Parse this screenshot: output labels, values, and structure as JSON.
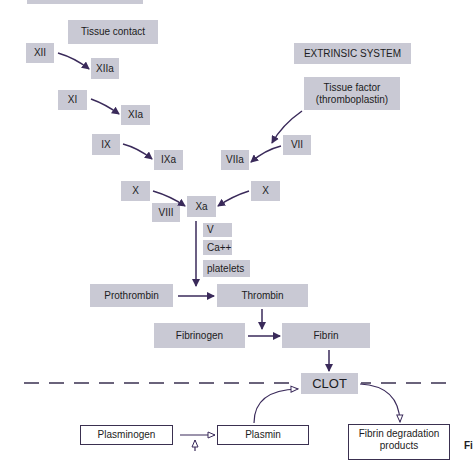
{
  "diagram": {
    "type": "coagulation cascade",
    "intrinsic": {
      "trigger": "Tissue contact",
      "steps": [
        {
          "from": "XII",
          "to": "XIIa"
        },
        {
          "from": "XI",
          "to": "XIa"
        },
        {
          "from": "IX",
          "to": "IXa"
        },
        {
          "from": "X",
          "to": "Xa",
          "cofactor": "VIII"
        }
      ]
    },
    "extrinsic": {
      "title": "EXTRINSIC SYSTEM",
      "trigger": "Tissue factor (thromboplastin)",
      "trigger_line1": "Tissue factor",
      "trigger_line2": "(thromboplastin)",
      "steps": [
        {
          "from": "VII",
          "to": "VIIa"
        },
        {
          "from": "X",
          "to": "Xa"
        }
      ]
    },
    "common": {
      "xa": "Xa",
      "cofactors": [
        "V",
        "Ca++",
        "platelets"
      ],
      "prothrombin": "Prothrombin",
      "thrombin": "Thrombin",
      "fibrinogen": "Fibrinogen",
      "fibrin": "Fibrin",
      "clot": "CLOT"
    },
    "fibrinolysis": {
      "plasminogen": "Plasminogen",
      "plasmin": "Plasmin",
      "fdp_line1": "Fibrin degradation",
      "fdp_line2": "products"
    },
    "partial_label": "Fi",
    "colors": {
      "box_fill": "#c9c9d4",
      "arrow": "#3a2a5a",
      "outline": "#3a3050"
    }
  }
}
